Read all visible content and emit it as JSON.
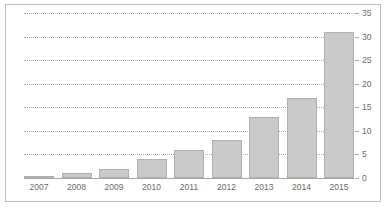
{
  "figure": {
    "top_clipped_text": "",
    "frame_color": "#bfbfbf",
    "background": "#ffffff"
  },
  "chart_data": {
    "type": "bar",
    "title": "",
    "subtitle": "",
    "xlabel": "",
    "ylabel": "",
    "categories": [
      "2007",
      "2008",
      "2009",
      "2010",
      "2011",
      "2012",
      "2013",
      "2014",
      "2015"
    ],
    "values": [
      0.5,
      1,
      2,
      4,
      6,
      8,
      13,
      17,
      31
    ],
    "series": [
      {
        "name": "",
        "values": [
          0.5,
          1,
          2,
          4,
          6,
          8,
          13,
          17,
          31
        ]
      }
    ],
    "ylim": [
      0,
      35
    ],
    "yticks": [
      0,
      5,
      10,
      15,
      20,
      25,
      30,
      35
    ],
    "ytick_labels": [
      "0",
      "5",
      "10",
      "15",
      "20",
      "25",
      "30",
      "35"
    ],
    "y_axis_position": "right",
    "grid": true,
    "grid_style": "dotted",
    "grid_color": "#a9a9a9",
    "legend": false,
    "legend_position": "none",
    "bar_color": "#c9c9c9",
    "bar_border_color": "#b0b0b0",
    "axis_color": "#a6a6a6",
    "tick_label_color": "#6b6b6b",
    "annotations": []
  }
}
